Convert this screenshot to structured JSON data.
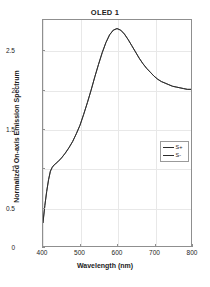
{
  "chart_data": {
    "type": "line",
    "title": "OLED 1",
    "xlabel": "Wavelength (nm)",
    "ylabel": "Normalized On-axis Emission Spectrum",
    "xlim": [
      400,
      800
    ],
    "ylim": [
      0,
      2.9
    ],
    "xticks": [
      400,
      500,
      600,
      700,
      800
    ],
    "xtick_labels": [
      "400",
      "500",
      "600",
      "700",
      "800"
    ],
    "yticks": [
      0,
      0.5,
      1,
      1.5,
      2,
      2.5
    ],
    "ytick_labels": [
      "0",
      "0.5",
      "1",
      "1.5",
      "2",
      "2.5"
    ],
    "grid": true,
    "legend_position": "center-right",
    "legend": [
      "S+",
      "S-"
    ],
    "series": [
      {
        "name": "S+",
        "color": "#2b2b2b",
        "x": [
          400,
          405,
          410,
          415,
          420,
          425,
          430,
          435,
          440,
          450,
          460,
          470,
          480,
          490,
          500,
          510,
          520,
          530,
          540,
          550,
          560,
          570,
          580,
          590,
          600,
          610,
          620,
          630,
          640,
          650,
          660,
          670,
          680,
          690,
          700,
          710,
          720,
          730,
          740,
          750,
          760,
          770,
          780,
          790,
          800
        ],
        "y": [
          0.3,
          0.52,
          0.7,
          0.85,
          0.96,
          1.01,
          1.04,
          1.06,
          1.08,
          1.13,
          1.19,
          1.26,
          1.34,
          1.44,
          1.55,
          1.69,
          1.84,
          2.0,
          2.17,
          2.33,
          2.48,
          2.61,
          2.71,
          2.77,
          2.79,
          2.77,
          2.72,
          2.65,
          2.57,
          2.49,
          2.41,
          2.34,
          2.28,
          2.23,
          2.18,
          2.14,
          2.11,
          2.09,
          2.07,
          2.05,
          2.04,
          2.03,
          2.02,
          2.01,
          2.01
        ]
      },
      {
        "name": "S-",
        "color": "#2b2b2b",
        "x": [
          400,
          405,
          410,
          415,
          420,
          425,
          430,
          435,
          440,
          450,
          460,
          470,
          480,
          490,
          500,
          510,
          520,
          530,
          540,
          550,
          560,
          570,
          580,
          590,
          600,
          610,
          620,
          630,
          640,
          650,
          660,
          670,
          680,
          690,
          700,
          710,
          720,
          730,
          740,
          750,
          760,
          770,
          780,
          790,
          800
        ],
        "y": [
          0.3,
          0.52,
          0.7,
          0.85,
          0.96,
          1.01,
          1.04,
          1.06,
          1.08,
          1.13,
          1.19,
          1.26,
          1.34,
          1.44,
          1.55,
          1.69,
          1.84,
          2.0,
          2.17,
          2.33,
          2.48,
          2.61,
          2.71,
          2.77,
          2.79,
          2.77,
          2.72,
          2.65,
          2.57,
          2.49,
          2.41,
          2.34,
          2.28,
          2.23,
          2.18,
          2.14,
          2.11,
          2.09,
          2.07,
          2.05,
          2.04,
          2.03,
          2.02,
          2.01,
          2.01
        ]
      }
    ]
  }
}
